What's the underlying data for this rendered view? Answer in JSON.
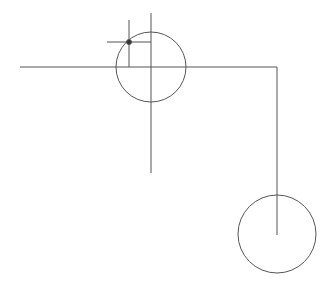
{
  "canvas": {
    "width": 326,
    "height": 285,
    "background": "#ffffff",
    "stroke": "#555555",
    "stroke_width": 1
  },
  "shapes": {
    "main_horizontal_line": {
      "x1": 20,
      "y1": 67,
      "x2": 277,
      "y2": 67
    },
    "main_vertical_line": {
      "x1": 151,
      "y1": 13,
      "x2": 151,
      "y2": 173
    },
    "right_vertical_line": {
      "x1": 277,
      "y1": 67,
      "x2": 277,
      "y2": 235
    },
    "upper_circle": {
      "cx": 151,
      "cy": 67,
      "r": 35
    },
    "lower_circle": {
      "cx": 277,
      "cy": 234,
      "r": 39
    },
    "crosshair_vertical": {
      "x1": 129,
      "y1": 20,
      "x2": 129,
      "y2": 67
    },
    "crosshair_horizontal": {
      "x1": 107,
      "y1": 42,
      "x2": 151,
      "y2": 42
    },
    "point_marker": {
      "cx": 129,
      "cy": 42,
      "r": 2.5,
      "fill": "#333333"
    }
  }
}
